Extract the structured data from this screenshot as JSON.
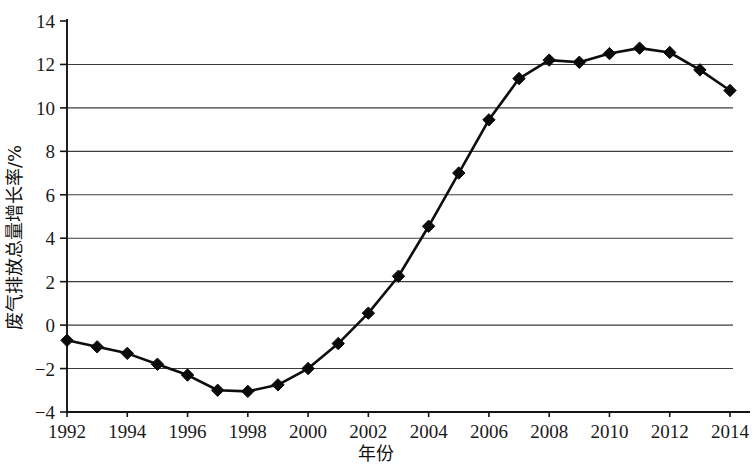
{
  "chart_data": {
    "type": "line",
    "title": "",
    "xlabel": "年份",
    "ylabel": "废气排放总量增长率/%",
    "x": [
      1992,
      1993,
      1994,
      1995,
      1996,
      1997,
      1998,
      1999,
      2000,
      2001,
      2002,
      2003,
      2004,
      2005,
      2006,
      2007,
      2008,
      2009,
      2010,
      2011,
      2012,
      2013,
      2014
    ],
    "values": [
      -0.7,
      -1.0,
      -1.3,
      -1.8,
      -2.3,
      -3.0,
      -3.05,
      -2.75,
      -2.0,
      -0.85,
      0.55,
      2.25,
      4.55,
      7.0,
      9.45,
      11.35,
      12.2,
      12.1,
      12.5,
      12.75,
      12.55,
      11.75,
      10.8
    ],
    "series": [
      {
        "name": "废气排放总量增长率",
        "values": [
          -0.7,
          -1.0,
          -1.3,
          -1.8,
          -2.3,
          -3.0,
          -3.05,
          -2.75,
          -2.0,
          -0.85,
          0.55,
          2.25,
          4.55,
          7.0,
          9.45,
          11.35,
          12.2,
          12.1,
          12.5,
          12.75,
          12.55,
          11.75,
          10.8
        ],
        "color": "#0a0a0a",
        "marker": "diamond"
      }
    ],
    "xlim": [
      1992,
      2014.6
    ],
    "ylim": [
      -4,
      14
    ],
    "x_tick_labels": [
      "1992",
      "1994",
      "1996",
      "1998",
      "2000",
      "2002",
      "2004",
      "2006",
      "2008",
      "2010",
      "2012",
      "2014"
    ],
    "x_tick_values": [
      1992,
      1994,
      1996,
      1998,
      2000,
      2002,
      2004,
      2006,
      2008,
      2010,
      2012,
      2014
    ],
    "y_tick_labels": [
      "-4",
      "-2",
      "0",
      "2",
      "4",
      "6",
      "8",
      "10",
      "12",
      "14"
    ],
    "y_tick_values": [
      -4,
      -2,
      0,
      2,
      4,
      6,
      8,
      10,
      12,
      14
    ],
    "grid": true,
    "grid_axis": "y",
    "legend": false,
    "legend_position": "none",
    "colors": {
      "line": "#0a0a0a",
      "marker": "#0a0a0a",
      "grid": "#3c3c3c",
      "axis": "#141414",
      "background": "#ffffff",
      "text": "#1a1a1a"
    }
  }
}
